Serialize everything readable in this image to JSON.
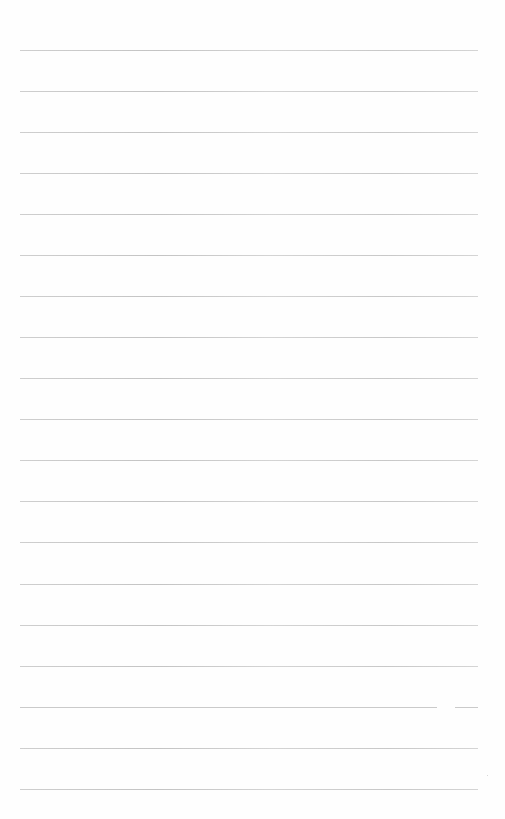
{
  "page": {
    "type": "lined-paper",
    "background_color": "#fefefe",
    "rule_color": "#c4c4c4",
    "rule_count": 19,
    "rule_left_px": 20,
    "rule_width_px": 458,
    "rules": [
      {
        "index": 0,
        "y": 50
      },
      {
        "index": 1,
        "y": 91
      },
      {
        "index": 2,
        "y": 132
      },
      {
        "index": 3,
        "y": 173
      },
      {
        "index": 4,
        "y": 214
      },
      {
        "index": 5,
        "y": 255
      },
      {
        "index": 6,
        "y": 296
      },
      {
        "index": 7,
        "y": 337
      },
      {
        "index": 8,
        "y": 378
      },
      {
        "index": 9,
        "y": 419
      },
      {
        "index": 10,
        "y": 460
      },
      {
        "index": 11,
        "y": 501
      },
      {
        "index": 12,
        "y": 542
      },
      {
        "index": 13,
        "y": 584
      },
      {
        "index": 14,
        "y": 625
      },
      {
        "index": 15,
        "y": 666
      },
      {
        "index": 16,
        "y": 707,
        "gap": true
      },
      {
        "index": 17,
        "y": 748
      },
      {
        "index": 18,
        "y": 789
      }
    ]
  }
}
